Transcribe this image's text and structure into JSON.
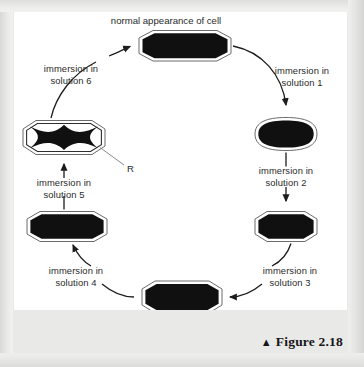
{
  "figure": {
    "caption_marker": "▲",
    "caption_text": "Figure 2.18",
    "title": "normal appearance of cell"
  },
  "diagram": {
    "type": "cycle-flow",
    "pointer_label": "R",
    "steps": [
      {
        "id": "solution-1",
        "label_line1": "immersion in",
        "label_line2": "solution 1",
        "from_cell": "cell-normal-top",
        "to_cell": "cell-right-upper"
      },
      {
        "id": "solution-2",
        "label_line1": "immersion in",
        "label_line2": "solution 2",
        "from_cell": "cell-right-upper",
        "to_cell": "cell-right-lower"
      },
      {
        "id": "solution-3",
        "label_line1": "immersion in",
        "label_line2": "solution 3",
        "from_cell": "cell-right-lower",
        "to_cell": "cell-bottom-center"
      },
      {
        "id": "solution-4",
        "label_line1": "immersion in",
        "label_line2": "solution 4",
        "from_cell": "cell-bottom-center",
        "to_cell": "cell-left-lower"
      },
      {
        "id": "solution-5",
        "label_line1": "immersion in",
        "label_line2": "solution 5",
        "from_cell": "cell-left-lower",
        "to_cell": "cell-left-upper-crenated"
      },
      {
        "id": "solution-6",
        "label_line1": "immersion in",
        "label_line2": "solution 6",
        "from_cell": "cell-left-upper-crenated",
        "to_cell": "cell-normal-top"
      }
    ],
    "cells": [
      {
        "id": "cell-normal-top",
        "position": "top-center",
        "appearance": "normal elongated hexagonal cell, fully filled"
      },
      {
        "id": "cell-right-upper",
        "position": "right-upper",
        "appearance": "rounded swollen cell, fully filled"
      },
      {
        "id": "cell-right-lower",
        "position": "right-lower",
        "appearance": "hexagonal cell, fully filled"
      },
      {
        "id": "cell-bottom-center",
        "position": "bottom-center",
        "appearance": "hexagonal cell, fully filled"
      },
      {
        "id": "cell-left-lower",
        "position": "left-lower",
        "appearance": "hexagonal cell, fully filled"
      },
      {
        "id": "cell-left-upper-crenated",
        "position": "left-upper",
        "appearance": "crenated cell, shrunken star-shaped contents inside membrane"
      }
    ]
  },
  "colors": {
    "cell_fill": "#101010",
    "cell_membrane": "#ffffff",
    "cell_outline": "#3d3d3d",
    "arrow": "#1d1d1d",
    "text": "#2a2a2a",
    "panel_background": "#ffffff",
    "page_background": "#e9e9e7"
  }
}
